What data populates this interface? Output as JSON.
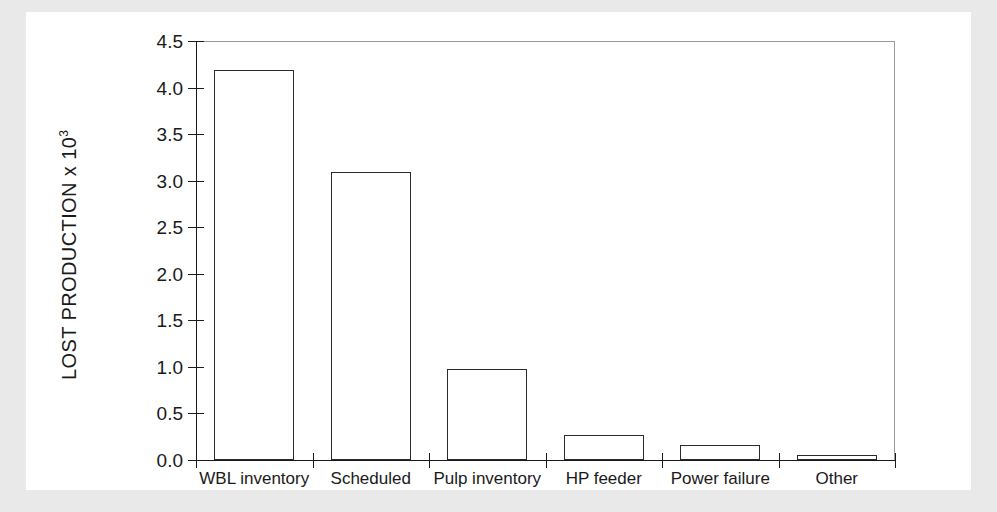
{
  "chart_data": {
    "type": "bar",
    "title": "",
    "xlabel": "",
    "ylabel": "LOST PRODUCTION x 10",
    "ylabel_exponent": "3",
    "categories": [
      "WBL inventory",
      "Scheduled",
      "Pulp inventory",
      "HP feeder",
      "Power failure",
      "Other"
    ],
    "values": [
      4.19,
      3.09,
      0.98,
      0.27,
      0.16,
      0.05
    ],
    "ylim": [
      0.0,
      4.5
    ],
    "ytick_labels": [
      "0.0",
      "0.5",
      "1.0",
      "1.5",
      "2.0",
      "2.5",
      "3.0",
      "3.5",
      "4.0",
      "4.5"
    ],
    "ytick_values": [
      0.0,
      0.5,
      1.0,
      1.5,
      2.0,
      2.5,
      3.0,
      3.5,
      4.0,
      4.5
    ],
    "grid": false,
    "legend": null,
    "bar_fill_color": "#ffffff",
    "bar_edge_color": "#2b2b2b",
    "axis_color": "#1a1a1a",
    "frame_color": "#9a9a9a",
    "plot_background": "#ffffff",
    "page_background": "#e9e9e9"
  }
}
